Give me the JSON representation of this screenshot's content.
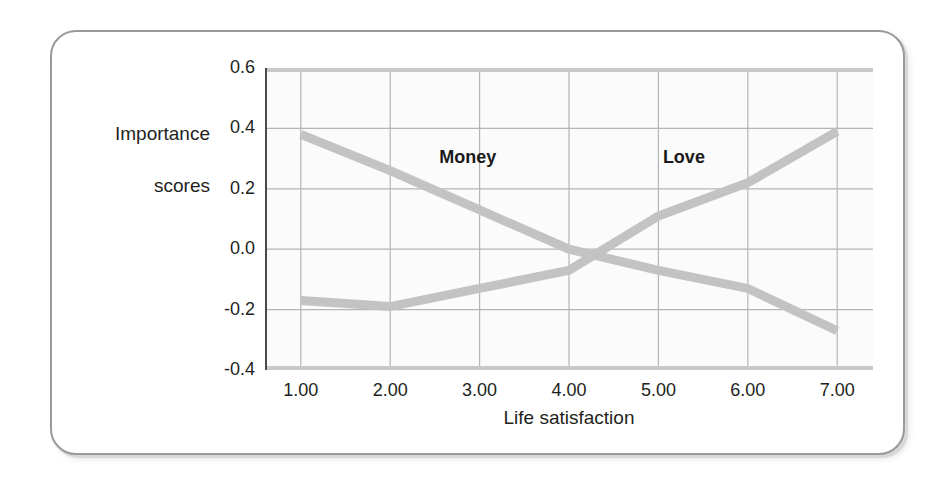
{
  "figure": {
    "background_color": "#ffffff",
    "card_border_color": "#9a9a9a",
    "plot_background_color": "#fbfbfb",
    "gridline_color": "#b5b5b5",
    "axis_color": "#c9c9c9"
  },
  "chart_data": {
    "type": "line",
    "title": "",
    "xlabel": "Life satisfaction",
    "ylabel": "Importance\nscores",
    "ylabel_line1": "Importance",
    "ylabel_line2": "scores",
    "x": [
      1.0,
      2.0,
      3.0,
      4.0,
      5.0,
      6.0,
      7.0
    ],
    "xticklabels": [
      "1.00",
      "2.00",
      "3.00",
      "4.00",
      "5.00",
      "6.00",
      "7.00"
    ],
    "yticklabels": [
      "0.6",
      "0.4",
      "0.2",
      "0.0",
      "-0.2",
      "-0.4"
    ],
    "yticks": [
      0.6,
      0.4,
      0.2,
      0.0,
      -0.2,
      -0.4
    ],
    "xlim": [
      0.6,
      7.4
    ],
    "ylim": [
      -0.4,
      0.6
    ],
    "grid": true,
    "legend": "inline-labels",
    "series": [
      {
        "name": "Money",
        "color": "#c3c3c3",
        "label_x": 2.55,
        "label_y": 0.3,
        "values": [
          0.38,
          0.26,
          0.13,
          0.0,
          -0.07,
          -0.13,
          -0.27
        ]
      },
      {
        "name": "Love",
        "color": "#c3c3c3",
        "label_x": 5.05,
        "label_y": 0.3,
        "values": [
          -0.17,
          -0.19,
          -0.13,
          -0.07,
          0.11,
          0.22,
          0.39
        ]
      }
    ]
  }
}
